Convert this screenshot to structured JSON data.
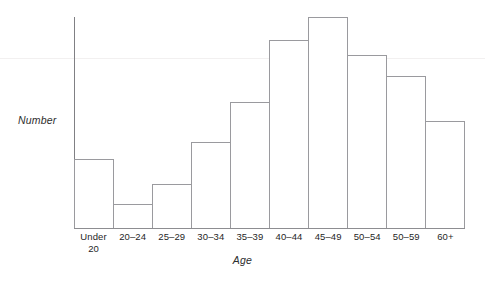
{
  "chart_data": {
    "type": "bar",
    "title": "",
    "subtitle": "",
    "xlabel": "Age",
    "ylabel": "Number",
    "categories": [
      "Under\n20",
      "20–24",
      "25–29",
      "30–34",
      "35–39",
      "40–44",
      "45–49",
      "50–54",
      "50–59",
      "60+"
    ],
    "values": [
      33,
      12,
      21,
      41,
      60,
      89,
      100,
      82,
      72,
      51
    ],
    "value_unit": "percent-of-tallest-bar",
    "ylim": [
      0,
      100
    ],
    "yticks": [],
    "ytick_labels": [],
    "grid": false,
    "legend": null,
    "legend_position": "none",
    "bar_style": {
      "fill": "#ffffff",
      "stroke": "#9a9a9e",
      "stroke_width": 1
    },
    "axis_color": "#808084",
    "baseline_color": "#8d8d91",
    "background": "#ffffff"
  },
  "axes": {
    "y_title": "Number",
    "x_title": "Age"
  },
  "artifacts": {
    "scan_line_color": "#f2f0f0"
  }
}
